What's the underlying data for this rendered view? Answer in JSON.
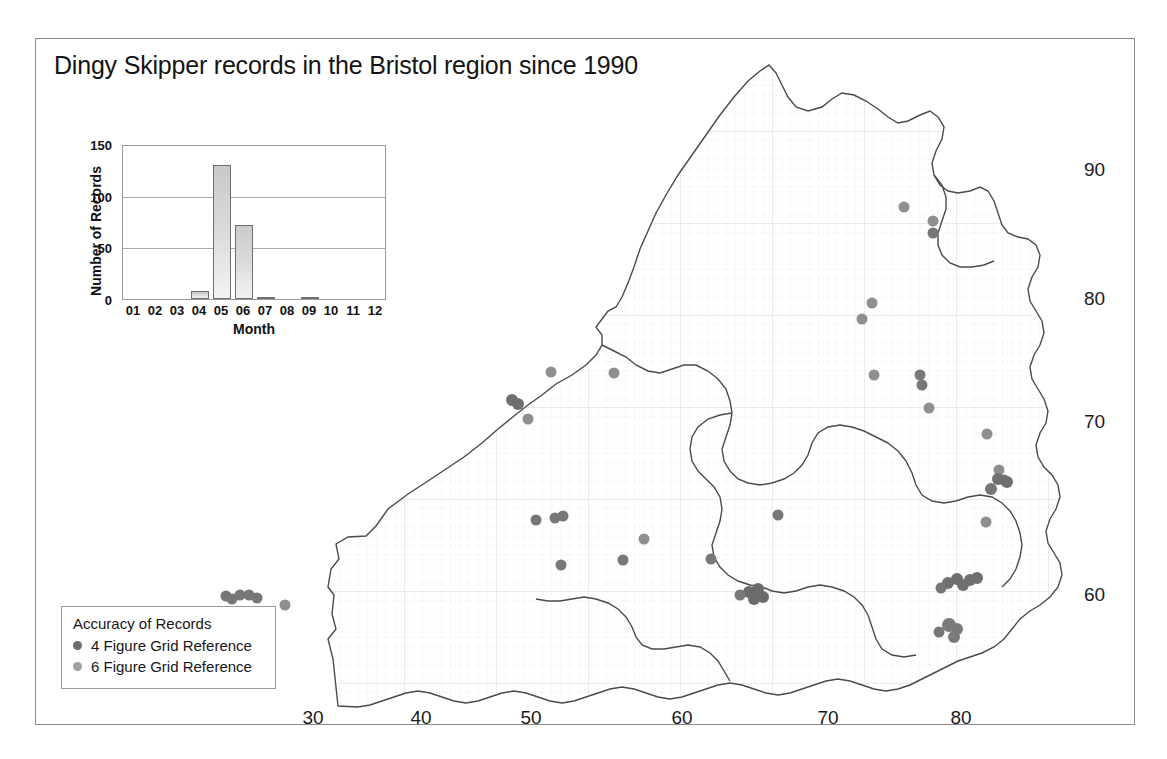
{
  "title": "Dingy Skipper records in the Bristol region since 1990",
  "map": {
    "x_ticks": [
      "30",
      "40",
      "50",
      "60",
      "70",
      "80"
    ],
    "y_ticks": [
      "90",
      "80",
      "70",
      "60"
    ],
    "grid": "fine-grey-grid",
    "outline_color": "#4a4a4a",
    "point_color_4fig": "#6b6b6b",
    "point_color_6fig": "#9a9a9a"
  },
  "legend": {
    "title": "Accuracy of Records",
    "items": [
      {
        "label": "4 Figure Grid Reference",
        "color": "#6d6d6d"
      },
      {
        "label": "6 Figure Grid Reference",
        "color": "#a0a0a0"
      }
    ]
  },
  "chart_data": {
    "type": "bar",
    "title": "",
    "categories": [
      "01",
      "02",
      "03",
      "04",
      "05",
      "06",
      "07",
      "08",
      "09",
      "10",
      "11",
      "12"
    ],
    "values": [
      0,
      0,
      0,
      8,
      130,
      72,
      2,
      0,
      2,
      0,
      0,
      0
    ],
    "xlabel": "Month",
    "ylabel": "Number of Records",
    "ylim": [
      0,
      150
    ],
    "yticks": [
      0,
      50,
      100,
      150
    ],
    "grid": true,
    "legend": "none"
  }
}
